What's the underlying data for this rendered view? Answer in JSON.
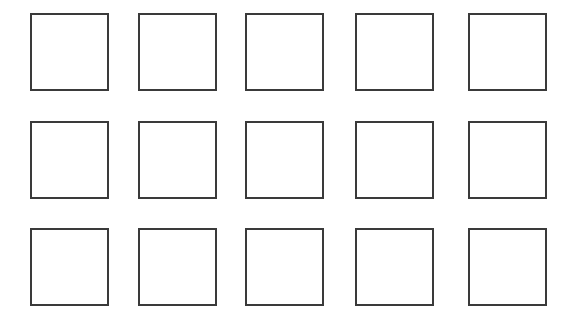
{
  "diagram": {
    "rows": 3,
    "columns": 5,
    "stroke_color": "#3a3a3a",
    "background": "#ffffff",
    "column_x": [
      30,
      138,
      245,
      355,
      468
    ],
    "row_y": [
      13,
      121,
      228
    ],
    "square_size": [
      79,
      78
    ]
  }
}
